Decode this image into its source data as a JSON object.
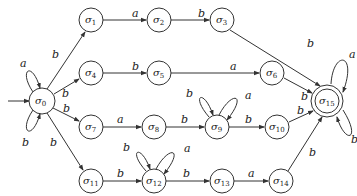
{
  "diagram": {
    "type": "finite-automaton",
    "start_state": "σ0",
    "accepting_states": [
      "σ15"
    ],
    "nodes": [
      {
        "id": "s0",
        "base": "σ",
        "sub": "0",
        "x": 42,
        "y": 101
      },
      {
        "id": "s1",
        "base": "σ",
        "sub": "1",
        "x": 91,
        "y": 20
      },
      {
        "id": "s2",
        "base": "σ",
        "sub": "2",
        "x": 159,
        "y": 20
      },
      {
        "id": "s3",
        "base": "σ",
        "sub": "3",
        "x": 222,
        "y": 20
      },
      {
        "id": "s4",
        "base": "σ",
        "sub": "4",
        "x": 91,
        "y": 73
      },
      {
        "id": "s5",
        "base": "σ",
        "sub": "5",
        "x": 159,
        "y": 73
      },
      {
        "id": "s6",
        "base": "σ",
        "sub": "6",
        "x": 272,
        "y": 73
      },
      {
        "id": "s7",
        "base": "σ",
        "sub": "7",
        "x": 91,
        "y": 127
      },
      {
        "id": "s8",
        "base": "σ",
        "sub": "8",
        "x": 154,
        "y": 127
      },
      {
        "id": "s9",
        "base": "σ",
        "sub": "9",
        "x": 217,
        "y": 127
      },
      {
        "id": "s10",
        "base": "σ",
        "sub": "10",
        "x": 277,
        "y": 127
      },
      {
        "id": "s11",
        "base": "σ",
        "sub": "11",
        "x": 91,
        "y": 181
      },
      {
        "id": "s12",
        "base": "σ",
        "sub": "12",
        "x": 154,
        "y": 181
      },
      {
        "id": "s13",
        "base": "σ",
        "sub": "13",
        "x": 222,
        "y": 181
      },
      {
        "id": "s14",
        "base": "σ",
        "sub": "14",
        "x": 281,
        "y": 181
      },
      {
        "id": "s15",
        "base": "σ",
        "sub": "15",
        "x": 327,
        "y": 101
      }
    ],
    "edges": [
      {
        "from": "σ0",
        "to": "σ0",
        "label": "a",
        "kind": "self-loop-top"
      },
      {
        "from": "σ0",
        "to": "σ0",
        "label": "b",
        "kind": "self-loop-bottom"
      },
      {
        "from": "σ0",
        "to": "σ1",
        "label": "b"
      },
      {
        "from": "σ0",
        "to": "σ4",
        "label": "b"
      },
      {
        "from": "σ0",
        "to": "σ7",
        "label": "b"
      },
      {
        "from": "σ0",
        "to": "σ11",
        "label": "b"
      },
      {
        "from": "σ1",
        "to": "σ2",
        "label": "a"
      },
      {
        "from": "σ2",
        "to": "σ3",
        "label": "b"
      },
      {
        "from": "σ3",
        "to": "σ15",
        "label": "b"
      },
      {
        "from": "σ4",
        "to": "σ5",
        "label": "b"
      },
      {
        "from": "σ5",
        "to": "σ6",
        "label": "a"
      },
      {
        "from": "σ6",
        "to": "σ15",
        "label": "b"
      },
      {
        "from": "σ7",
        "to": "σ8",
        "label": "a"
      },
      {
        "from": "σ8",
        "to": "σ9",
        "label": "b"
      },
      {
        "from": "σ9",
        "to": "σ9",
        "label": "b",
        "kind": "self-loop-left"
      },
      {
        "from": "σ9",
        "to": "σ9",
        "label": "a",
        "kind": "self-loop-right"
      },
      {
        "from": "σ9",
        "to": "σ10",
        "label": "b"
      },
      {
        "from": "σ10",
        "to": "σ15",
        "label": "b"
      },
      {
        "from": "σ11",
        "to": "σ12",
        "label": "b"
      },
      {
        "from": "σ12",
        "to": "σ12",
        "label": "b",
        "kind": "self-loop-left"
      },
      {
        "from": "σ12",
        "to": "σ12",
        "label": "a",
        "kind": "self-loop-right"
      },
      {
        "from": "σ12",
        "to": "σ13",
        "label": "b"
      },
      {
        "from": "σ13",
        "to": "σ14",
        "label": "a"
      },
      {
        "from": "σ14",
        "to": "σ15",
        "label": "b"
      },
      {
        "from": "σ15",
        "to": "σ15",
        "label": "a",
        "kind": "self-loop-top"
      },
      {
        "from": "σ15",
        "to": "σ15",
        "label": "b",
        "kind": "self-loop-bottom"
      }
    ],
    "labels": {
      "l_s0_top": "a",
      "l_s0_bot": "b",
      "l_0_1": "b",
      "l_0_4": "b",
      "l_0_7": "b",
      "l_0_11": "b",
      "l_1_2": "a",
      "l_2_3": "b",
      "l_3_15": "b",
      "l_4_5": "b",
      "l_5_6": "a",
      "l_6_15": "b",
      "l_7_8": "a",
      "l_8_9": "b",
      "l_9_left": "b",
      "l_9_right": "a",
      "l_9_10": "b",
      "l_10_15": "b",
      "l_11_12": "b",
      "l_12_left": "b",
      "l_12_right": "a",
      "l_12_13": "b",
      "l_13_14": "a",
      "l_14_15": "b",
      "l_15_top": "a",
      "l_15_bot": "b"
    }
  }
}
